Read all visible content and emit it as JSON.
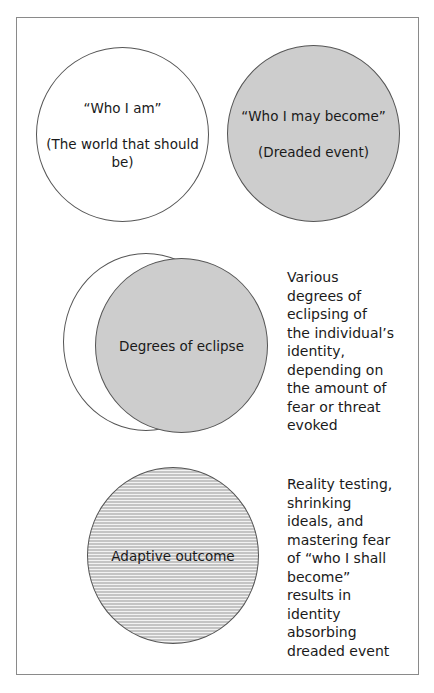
{
  "diagram": {
    "panel_top": {
      "left_circle": {
        "line1": "“Who I am”",
        "line2": "(The world that should be)",
        "fill": "#ffffff"
      },
      "right_circle": {
        "line1": "“Who I may become”",
        "line2": "(Dreaded event)",
        "fill": "#cdcdcd"
      }
    },
    "panel_middle": {
      "circle_label": "Degrees of eclipse",
      "back_circle_fill": "#ffffff",
      "front_circle_fill": "#cdcdcd",
      "description": "Various\ndegrees of\neclipsing of\nthe individual’s\nidentity,\ndepending on\nthe amount of\nfear or threat\nevoked"
    },
    "panel_bottom": {
      "circle_label": "Adaptive outcome",
      "fill_pattern": "horizontal-stripes",
      "description": "Reality testing,\nshrinking\nideals, and\nmastering fear\nof  “who I shall\nbecome”\nresults in\nidentity\nabsorbing\ndreaded event"
    }
  }
}
